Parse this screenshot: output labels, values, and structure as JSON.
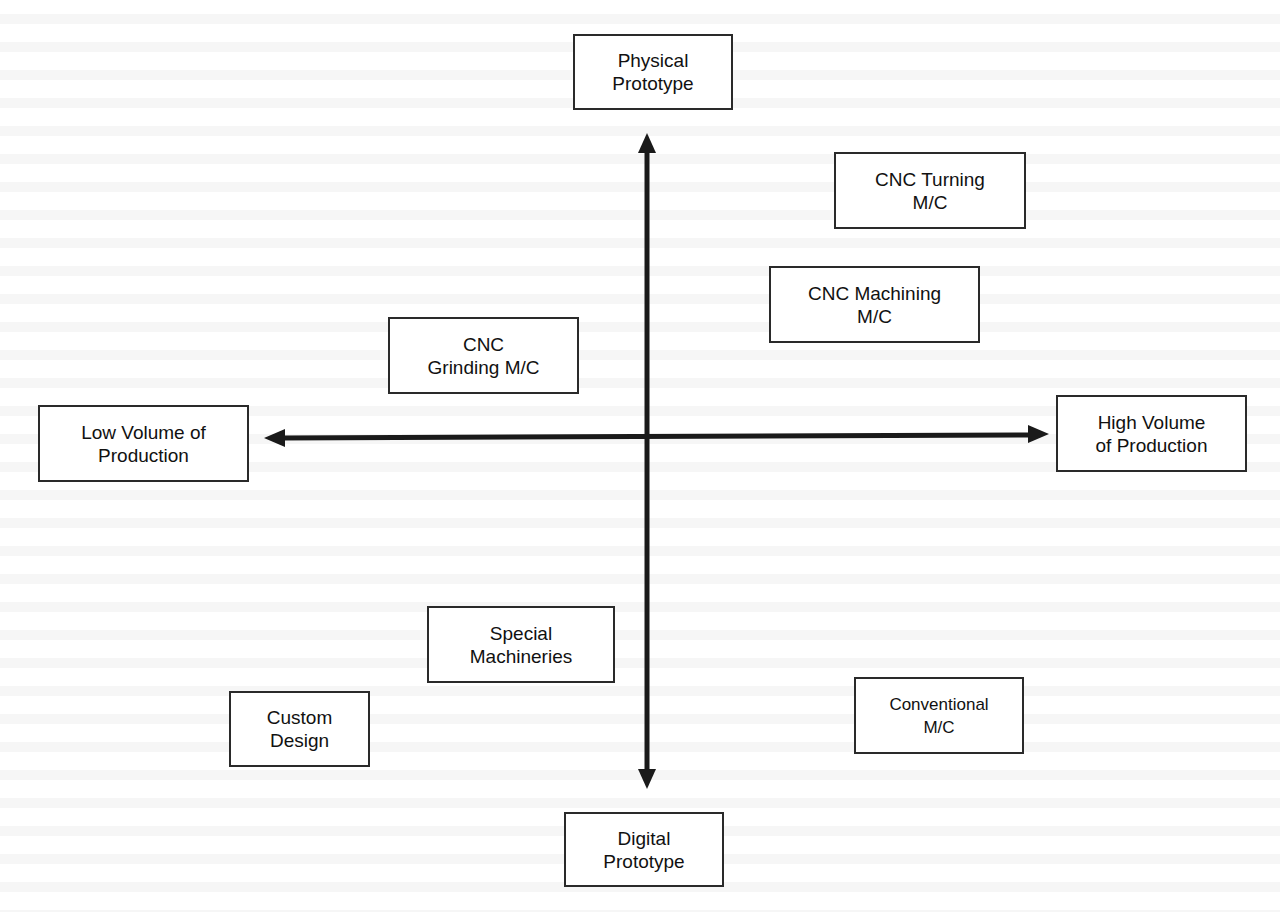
{
  "diagram": {
    "type": "quadrant-axes",
    "axes": {
      "vertical": {
        "top_label": [
          "Physical",
          "Prototype"
        ],
        "bottom_label": [
          "Digital",
          "Prototype"
        ]
      },
      "horizontal": {
        "left_label": [
          "Low Volume of",
          "Production"
        ],
        "right_label": [
          "High Volume",
          "of Production"
        ]
      }
    },
    "nodes": {
      "cnc_turning": [
        "CNC Turning",
        "M/C"
      ],
      "cnc_machining": [
        "CNC Machining",
        "M/C"
      ],
      "cnc_grinding": [
        "CNC",
        "Grinding M/C"
      ],
      "special_machineries": [
        "Special",
        "Machineries"
      ],
      "custom_design": [
        "Custom",
        "Design"
      ],
      "conventional": [
        "Conventional",
        "M/C"
      ]
    },
    "colors": {
      "line": "#1a1a1a",
      "border": "#2a2a2a",
      "background": "#ffffff"
    }
  }
}
